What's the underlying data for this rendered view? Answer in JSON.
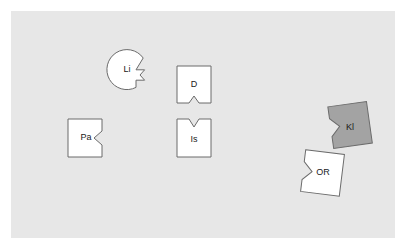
{
  "canvas": {
    "width": 405,
    "height": 248,
    "background_color": "#ffffff"
  },
  "panel": {
    "name": "diagram-backdrop",
    "x": 11,
    "y": 11,
    "width": 384,
    "height": 227,
    "fill_color": "#e7e7e7"
  },
  "style": {
    "piece_stroke_color": "#6b6b6b",
    "piece_fill_white": "#ffffff",
    "piece_fill_gray": "#a3a3a3",
    "label_color": "#1a1a1a",
    "label_font_size": 9
  },
  "pieces": [
    {
      "id": "li",
      "label": "Li",
      "shape": "circle-with-right-tab",
      "fill": "#ffffff",
      "rotation": 0,
      "center": {
        "x": 128,
        "y": 71
      },
      "radius": 20,
      "label_pos": {
        "x": 127,
        "y": 70
      },
      "path": "M 143.2 58.0 A 20 20 0 1 0 136.0 87.4 L 136.0 80.2 L 144.6 80.2 L 140.0 75.0 L 144.6 69.8 L 136.0 69.8 Z"
    },
    {
      "id": "pa",
      "label": "Pa",
      "shape": "square-notch-right",
      "fill": "#ffffff",
      "rotation": 0,
      "label_pos": {
        "x": 86,
        "y": 138
      },
      "path": "M 68 119 L 102 119 L 102 131 L 94 138 L 102 145 L 102 157 L 68 157 Z"
    },
    {
      "id": "d",
      "label": "D",
      "shape": "square-notch-bottom",
      "fill": "#ffffff",
      "rotation": 0,
      "label_pos": {
        "x": 194,
        "y": 85
      },
      "path": "M 177 66 L 211 66 L 211 103 L 199 103 L 194 96 L 189 103 L 177 103 Z"
    },
    {
      "id": "is",
      "label": "Is",
      "shape": "square-notch-top",
      "fill": "#ffffff",
      "rotation": 0,
      "label_pos": {
        "x": 194,
        "y": 140
      },
      "path": "M 177 119 L 189 119 L 194 127 L 199 119 L 211 119 L 211 157 L 177 157 Z"
    },
    {
      "id": "kl",
      "label": "Kl",
      "shape": "square-notch-left",
      "fill": "#a3a3a3",
      "rotation": -8,
      "label_pos": {
        "x": 350,
        "y": 128
      },
      "path": "M 331 104 L 370 104 L 370 146 L 331 146 L 331 134 L 340 125 L 331 116 Z"
    },
    {
      "id": "or",
      "label": "OR",
      "shape": "square-notch-left",
      "fill": "#ffffff",
      "rotation": 7,
      "label_pos": {
        "x": 323,
        "y": 173
      },
      "path": "M 303 152 L 342 152 L 342 194 L 303 194 L 303 182 L 312 173 L 303 164 Z"
    }
  ]
}
